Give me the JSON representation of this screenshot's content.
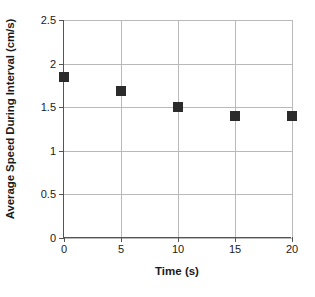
{
  "chart_data": {
    "type": "scatter",
    "title": "",
    "xlabel": "Time (s)",
    "ylabel": "Average Speed During Interval (cm/s)",
    "x": [
      0,
      5,
      10,
      15,
      20
    ],
    "values": [
      1.85,
      1.69,
      1.5,
      1.4,
      1.4
    ],
    "series": [
      {
        "name": "Average Speed During Interval",
        "values": [
          1.85,
          1.69,
          1.5,
          1.4,
          1.4
        ]
      }
    ],
    "xlim": [
      0,
      20
    ],
    "ylim": [
      0,
      2.5
    ],
    "xticks": [
      0,
      5,
      10,
      15,
      20
    ],
    "yticks": [
      0,
      0.5,
      1,
      1.5,
      2,
      2.5
    ],
    "xtick_labels": [
      "0",
      "5",
      "10",
      "15",
      "20"
    ],
    "ytick_labels": [
      "0",
      "0.5",
      "1",
      "1.5",
      "2",
      "2.5"
    ],
    "grid": true,
    "grid_axis": "both",
    "legend": false,
    "legend_position": "none",
    "marker_shape": "square",
    "marker_color": "#2b2b2b",
    "grid_color": "#b9b9b9",
    "axis_color": "#555555",
    "background_color": "#ffffff"
  }
}
